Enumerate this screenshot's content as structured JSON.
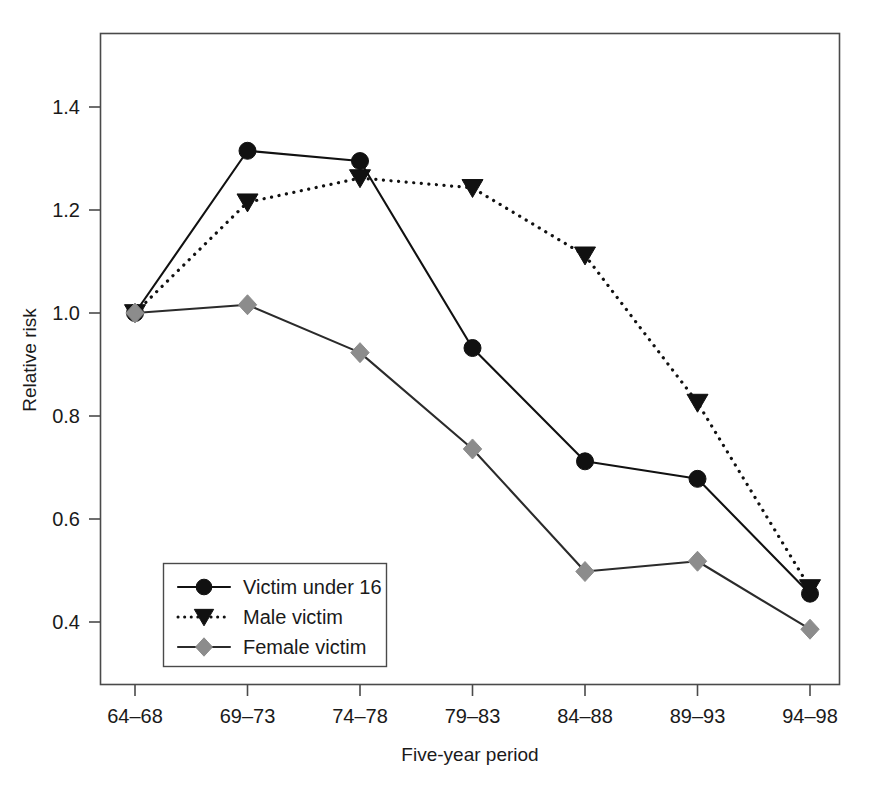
{
  "chart_data": {
    "type": "line",
    "title": "",
    "subtitle": "",
    "xlabel": "Five-year period",
    "ylabel": "Relative risk",
    "categories": [
      "64–68",
      "69–73",
      "74–78",
      "79–83",
      "84–88",
      "89–93",
      "94–98"
    ],
    "yticks": [
      "0.4",
      "0.6",
      "0.8",
      "1.0",
      "1.2",
      "1.4"
    ],
    "ytick_values": [
      0.4,
      0.6,
      0.8,
      1.0,
      1.2,
      1.4
    ],
    "ylim": [
      0.33,
      1.52
    ],
    "grid": false,
    "legend_position": "bottom-left",
    "series": [
      {
        "name": "Victim under 16",
        "marker": "circle",
        "line_style": "solid",
        "color": "#111111",
        "values": [
          1.0,
          1.315,
          1.295,
          0.932,
          0.712,
          0.678,
          0.455
        ]
      },
      {
        "name": "Male victim",
        "marker": "triangle-down",
        "line_style": "dotted",
        "color": "#111111",
        "values": [
          1.0,
          1.215,
          1.262,
          1.243,
          1.112,
          0.826,
          0.466
        ]
      },
      {
        "name": "Female victim",
        "marker": "diamond",
        "line_style": "solid",
        "color": "#8c8c8c",
        "values": [
          1.0,
          1.016,
          0.923,
          0.736,
          0.498,
          0.518,
          0.386
        ]
      }
    ]
  },
  "legend": {
    "items": [
      {
        "label": "Victim under 16",
        "marker": "circle",
        "line_style": "solid",
        "color": "#111111"
      },
      {
        "label": "Male victim",
        "marker": "triangle-down",
        "line_style": "dotted",
        "color": "#111111"
      },
      {
        "label": "Female victim",
        "marker": "diamond",
        "line_style": "solid",
        "color": "#8c8c8c"
      }
    ]
  },
  "axes": {
    "x_title": "Five-year period",
    "y_title": "Relative risk"
  },
  "colors": {
    "frame": "#4a4a4a",
    "dark_series": "#111111",
    "gray_series": "#8c8c8c",
    "background": "#ffffff"
  }
}
